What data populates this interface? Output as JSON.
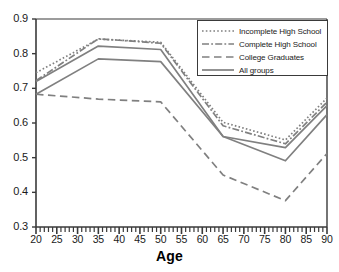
{
  "chart_data": {
    "type": "line",
    "title": "",
    "xlabel": "Age",
    "ylabel": "",
    "xlim": [
      20,
      90
    ],
    "ylim": [
      0.3,
      0.9
    ],
    "grid": false,
    "legend_position": "top-right",
    "x": [
      20,
      35,
      50,
      65,
      80,
      90
    ],
    "xticks": [
      20,
      25,
      30,
      35,
      40,
      45,
      50,
      55,
      60,
      65,
      70,
      75,
      80,
      85,
      90
    ],
    "yticks": [
      0.3,
      0.4,
      0.5,
      0.6,
      0.7,
      0.8,
      0.9
    ],
    "ytick_labels": [
      "0.3",
      "0.4",
      "0.5",
      "0.6",
      "0.7",
      "0.8",
      "0.9"
    ],
    "xtick_labels": [
      "20",
      "25",
      "30",
      "35",
      "40",
      "45",
      "50",
      "55",
      "60",
      "65",
      "70",
      "75",
      "80",
      "85",
      "90"
    ],
    "series": [
      {
        "name": "Incomplete High School",
        "style": "dotted",
        "color": "#808080",
        "values": [
          0.745,
          0.842,
          0.833,
          0.602,
          0.551,
          0.672
        ]
      },
      {
        "name": "Complete High School",
        "style": "dash-dot",
        "color": "#808080",
        "values": [
          0.722,
          0.843,
          0.83,
          0.592,
          0.54,
          0.66
        ]
      },
      {
        "name": "College Graduates",
        "style": "dashed",
        "color": "#808080",
        "values": [
          0.683,
          0.669,
          0.661,
          0.45,
          0.376,
          0.512
        ]
      },
      {
        "name": "All groups",
        "style": "solid",
        "color": "#808080",
        "values": [
          0.72,
          0.822,
          0.812,
          0.561,
          0.529,
          0.65
        ]
      },
      {
        "name": "All groups lower",
        "style": "solid",
        "color": "#808080",
        "values": [
          0.683,
          0.785,
          0.777,
          0.561,
          0.491,
          0.624
        ]
      }
    ]
  },
  "legend": {
    "items": [
      {
        "label": "Incomplete High School",
        "style": "dotted"
      },
      {
        "label": "Complete High School",
        "style": "dash-dot"
      },
      {
        "label": "College Graduates",
        "style": "dashed"
      },
      {
        "label": "All groups",
        "style": "solid"
      }
    ]
  },
  "axis": {
    "x_title": "Age"
  },
  "colors": {
    "line": "#808080",
    "axis": "#3a3a3a",
    "text": "#1a1a1a"
  }
}
